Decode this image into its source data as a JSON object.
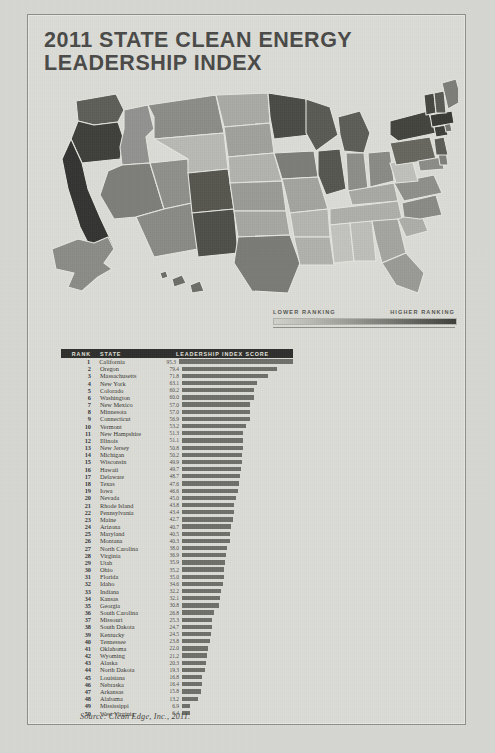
{
  "title": {
    "line1": "2011 STATE CLEAN ENERGY",
    "line2": "LEADERSHIP INDEX"
  },
  "legend": {
    "low_label": "LOWER RANKING",
    "high_label": "HIGHER RANKING",
    "gradient_from": "#d2d2cc",
    "gradient_to": "#3d3d3a"
  },
  "table": {
    "headers": {
      "rank": "RANK",
      "state": "STATE",
      "score": "LEADERSHIP INDEX SCORE"
    },
    "header_bg": "#2f2f2d",
    "bar_color": "#6f6f6a"
  },
  "source": "Source: Clean Edge, Inc., 2011.",
  "chart_data": {
    "type": "bar",
    "title": "2011 STATE CLEAN ENERGY LEADERSHIP INDEX",
    "xlabel": "Leadership Index Score",
    "ylabel": "State",
    "orientation": "horizontal",
    "xlim": [
      0,
      100
    ],
    "grid": false,
    "legend_position": "none",
    "categories": [
      "California",
      "Oregon",
      "Massachusetts",
      "New York",
      "Colorado",
      "Washington",
      "New Mexico",
      "Minnesota",
      "Connecticut",
      "Vermont",
      "New Hampshire",
      "Illinois",
      "New Jersey",
      "Michigan",
      "Wisconsin",
      "Hawaii",
      "Delaware",
      "Texas",
      "Iowa",
      "Nevada",
      "Rhode Island",
      "Pennsylvania",
      "Maine",
      "Arizona",
      "Maryland",
      "Montana",
      "North Carolina",
      "Virginia",
      "Utah",
      "Ohio",
      "Florida",
      "Idaho",
      "Indiana",
      "Kansas",
      "Georgia",
      "South Carolina",
      "Missouri",
      "South Dakota",
      "Kentucky",
      "Tennessee",
      "Oklahoma",
      "Wyoming",
      "Alaska",
      "North Dakota",
      "Louisiana",
      "Nebraska",
      "Arkansas",
      "Alabama",
      "Mississippi",
      "West Virginia"
    ],
    "values": [
      95.3,
      79.4,
      71.8,
      63.1,
      60.2,
      60.0,
      57.0,
      57.0,
      56.9,
      53.2,
      51.3,
      51.1,
      50.8,
      50.2,
      49.9,
      49.7,
      48.7,
      47.6,
      46.6,
      45.0,
      43.8,
      43.4,
      42.7,
      40.7,
      40.5,
      40.3,
      38.0,
      36.9,
      35.9,
      35.2,
      35.0,
      34.6,
      32.2,
      32.1,
      30.8,
      26.8,
      25.3,
      24.7,
      24.5,
      23.8,
      22.0,
      21.2,
      20.3,
      19.3,
      16.8,
      16.4,
      15.8,
      13.2,
      6.9,
      6.4
    ],
    "ranks": [
      1,
      2,
      3,
      4,
      5,
      6,
      7,
      8,
      9,
      10,
      11,
      12,
      13,
      14,
      15,
      16,
      17,
      18,
      19,
      20,
      21,
      22,
      23,
      24,
      25,
      26,
      27,
      28,
      29,
      30,
      31,
      32,
      33,
      34,
      35,
      36,
      37,
      38,
      39,
      40,
      41,
      42,
      43,
      44,
      45,
      46,
      47,
      48,
      49,
      50
    ]
  }
}
